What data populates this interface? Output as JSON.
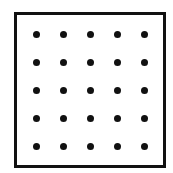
{
  "diagram": {
    "type": "dot-grid",
    "rows": 5,
    "columns": 5,
    "dot_color": "#111111",
    "border_color": "#111111",
    "background_color": "#ffffff",
    "frame": {
      "left": 14,
      "top": 12,
      "width": 152,
      "height": 156,
      "border_width": 3
    },
    "dot_diameter": 7,
    "column_centers": [
      36,
      63,
      90,
      117,
      144
    ],
    "row_centers": [
      34,
      62,
      90,
      118,
      146
    ]
  }
}
